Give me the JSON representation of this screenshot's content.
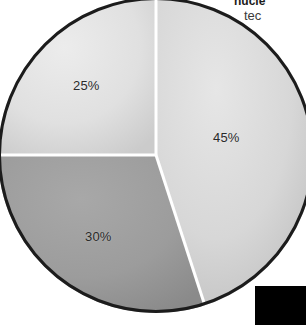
{
  "chart_data": {
    "type": "pie",
    "title": "",
    "categories": [
      "45%",
      "25%",
      "30%"
    ],
    "values": [
      45,
      25,
      30
    ],
    "labels": [
      "45%",
      "25%",
      "30%"
    ],
    "units": "percent",
    "total": 100,
    "legend": "none",
    "grid": false,
    "slices": [
      {
        "label": "45%",
        "value": 45,
        "color": "#d4d4d4",
        "start_angle_deg": 0,
        "end_angle_deg": 162,
        "position": "right"
      },
      {
        "label": "30%",
        "value": 30,
        "color": "#9a9a9a",
        "start_angle_deg": 162,
        "end_angle_deg": 270,
        "position": "lower-left"
      },
      {
        "label": "25%",
        "value": 25,
        "color": "#dedede",
        "start_angle_deg": 270,
        "end_angle_deg": 360,
        "position": "upper-left"
      }
    ],
    "separator_color": "#ffffff",
    "outline_color": "#1c1c1c"
  },
  "chart": {
    "label_45": "45%",
    "label_25": "25%",
    "label_30": "30%"
  },
  "caption": {
    "line1": "nucle",
    "line2": "tec"
  },
  "colors": {
    "slice_45": "#d4d4d4",
    "slice_25": "#dedede",
    "slice_30": "#9a9a9a",
    "outline": "#1c1c1c",
    "separator": "#ffffff",
    "label_text": "#2a2a2a",
    "corner_block": "#000000",
    "background": "#ffffff"
  }
}
